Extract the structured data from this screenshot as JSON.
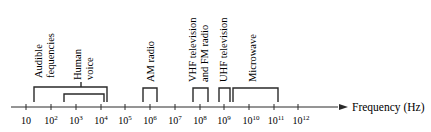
{
  "diagram": {
    "axis": {
      "label": "Frequency (Hz)",
      "ticks": [
        {
          "base": "10",
          "exp": ""
        },
        {
          "base": "10",
          "exp": "2"
        },
        {
          "base": "10",
          "exp": "3"
        },
        {
          "base": "10",
          "exp": "4"
        },
        {
          "base": "10",
          "exp": "5"
        },
        {
          "base": "10",
          "exp": "6"
        },
        {
          "base": "10",
          "exp": "7"
        },
        {
          "base": "10",
          "exp": "8"
        },
        {
          "base": "10",
          "exp": "9"
        },
        {
          "base": "10",
          "exp": "10"
        },
        {
          "base": "10",
          "exp": "11"
        },
        {
          "base": "10",
          "exp": "12"
        }
      ]
    },
    "bands": [
      {
        "name": "audible-frequencies",
        "lines": [
          "Audible",
          "fequencies"
        ]
      },
      {
        "name": "human-voice",
        "lines": [
          "Human",
          "voice"
        ]
      },
      {
        "name": "am-radio",
        "lines": [
          "AM radio"
        ]
      },
      {
        "name": "vhf-fm",
        "lines": [
          "VHF television",
          "and FM radio"
        ]
      },
      {
        "name": "uhf-television",
        "lines": [
          "UHF television"
        ]
      },
      {
        "name": "microwave",
        "lines": [
          "Microwave"
        ]
      }
    ]
  }
}
